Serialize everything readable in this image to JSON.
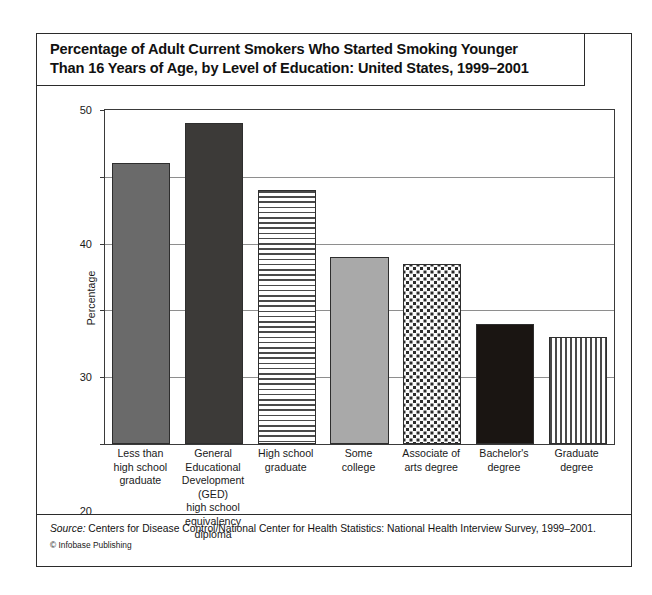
{
  "title": {
    "line1": "Percentage of Adult Current Smokers Who Started Smoking Younger",
    "line2": "Than 16 Years of Age, by Level of Education: United States, 1999–2001"
  },
  "footer": {
    "source_label": "Source:",
    "source_text": " Centers for Disease Control/National Center for Health Statistics: National Health Interview Survey, 1999–2001.",
    "copyright": "© Infobase Publishing"
  },
  "chart_data": {
    "type": "bar",
    "title": "Percentage of Adult Current Smokers Who Started Smoking Younger Than 16 Years of Age, by Level of Education: United States, 1999–2001",
    "xlabel": "",
    "ylabel": "Percentage",
    "ylim": [
      0,
      50
    ],
    "yticks": [
      0,
      10,
      20,
      30,
      40,
      50
    ],
    "ytick_labels": [
      "0",
      "10",
      "20",
      "30",
      "40",
      "50"
    ],
    "grid": true,
    "legend": "none",
    "categories": [
      "Less than\nhigh school\ngraduate",
      "General\nEducational\nDevelopment\n(GED)\nhigh school\nequivalency\ndiploma",
      "High school\ngraduate",
      "Some\ncollege",
      "Associate of\narts degree",
      "Bachelor's\ndegree",
      "Graduate\ndegree"
    ],
    "values": [
      42,
      48,
      38,
      28,
      27,
      18,
      16
    ],
    "bars": [
      {
        "label_lines": [
          "Less than",
          "high school",
          "graduate"
        ],
        "value": 42,
        "fill": "solid-medium",
        "color": "#6a6a6a"
      },
      {
        "label_lines": [
          "General",
          "Educational",
          "Development",
          "(GED)",
          "high school",
          "equivalency",
          "diploma"
        ],
        "value": 48,
        "fill": "solid-dark",
        "color": "#3c3a38"
      },
      {
        "label_lines": [
          "High school",
          "graduate"
        ],
        "value": 38,
        "fill": "hstripe",
        "color": "#4a4a4a"
      },
      {
        "label_lines": [
          "Some",
          "college"
        ],
        "value": 28,
        "fill": "solid-light",
        "color": "#a9a9a9"
      },
      {
        "label_lines": [
          "Associate of",
          "arts degree"
        ],
        "value": 27,
        "fill": "dots",
        "color": "#2b2b2b"
      },
      {
        "label_lines": [
          "Bachelor's",
          "degree"
        ],
        "value": 18,
        "fill": "solid-black",
        "color": "#1a1512"
      },
      {
        "label_lines": [
          "Graduate",
          "degree"
        ],
        "value": 16,
        "fill": "vstripe",
        "color": "#4a4a4a"
      }
    ]
  }
}
